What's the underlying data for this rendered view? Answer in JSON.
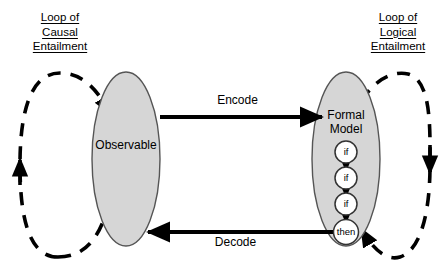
{
  "diagram": {
    "title_left": {
      "lines": [
        "Loop of",
        "Causal",
        "Entailment"
      ]
    },
    "title_right": {
      "lines": [
        "Loop of",
        "Logical",
        "Entailment"
      ]
    },
    "nodes": [
      {
        "id": "observable",
        "label": "Observable",
        "shape": "ellipse",
        "fill": "#d6d6d6",
        "stroke": "#555555"
      },
      {
        "id": "formal-model",
        "label_line1": "Formal",
        "label_line2": "Model",
        "shape": "ellipse",
        "fill": "#d6d6d6",
        "stroke": "#555555"
      }
    ],
    "edges": [
      {
        "id": "encode",
        "label": "Encode",
        "from": "observable",
        "to": "formal-model",
        "style": "solid",
        "direction": "right"
      },
      {
        "id": "decode",
        "label": "Decode",
        "from": "formal-model",
        "to": "observable",
        "style": "solid",
        "direction": "left"
      }
    ],
    "loops": [
      {
        "id": "causal-loop",
        "style": "dashed",
        "around": "observable",
        "stroke": "#000000"
      },
      {
        "id": "logical-loop",
        "style": "dashed",
        "around": "formal-model",
        "stroke": "#000000"
      }
    ],
    "inference_chain": [
      {
        "id": "rule-if-1",
        "label": "if"
      },
      {
        "id": "rule-if-2",
        "label": "if"
      },
      {
        "id": "rule-if-3",
        "label": "if"
      },
      {
        "id": "rule-then",
        "label": "then"
      }
    ],
    "colors": {
      "ellipse_fill": "#d6d6d6",
      "ellipse_stroke": "#555555",
      "arrow": "#000000",
      "background": "#ffffff",
      "circle_fill": "#ffffff",
      "circle_stroke": "#333333"
    }
  }
}
